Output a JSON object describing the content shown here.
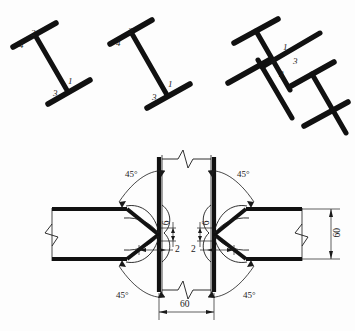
{
  "drawing": {
    "title": "Welded beam-to-column joint weld sequence detail",
    "ink_color": "#111111",
    "thin_line_color": "#1a1a1a"
  },
  "figures": [
    {
      "id": "fig-1",
      "name": "i-beam-tilted-left",
      "description": "Tilted I-section with weld pass numbers",
      "labels": [
        {
          "text": "2",
          "name": "weld-pass-2"
        },
        {
          "text": "4",
          "name": "weld-pass-4"
        },
        {
          "text": "1",
          "name": "weld-pass-1"
        },
        {
          "text": "3",
          "name": "weld-pass-3"
        }
      ]
    },
    {
      "id": "fig-2",
      "name": "i-beam-tilted-middle",
      "description": "Tilted I-section with weld pass numbers",
      "labels": [
        {
          "text": "2",
          "name": "weld-pass-2"
        },
        {
          "text": "4",
          "name": "weld-pass-4"
        },
        {
          "text": "1",
          "name": "weld-pass-1"
        },
        {
          "text": "3",
          "name": "weld-pass-3"
        }
      ]
    },
    {
      "id": "fig-3",
      "name": "double-i-beam-cross",
      "description": "Crossed double-T section with weld pass numbers at centre",
      "labels": [
        {
          "text": "1",
          "name": "weld-pass-1"
        },
        {
          "text": "4",
          "name": "weld-pass-4"
        },
        {
          "text": "3",
          "name": "weld-pass-3"
        },
        {
          "text": "2",
          "name": "weld-pass-2"
        }
      ]
    }
  ],
  "detail": {
    "name": "weld-groove-detail",
    "angles": {
      "top_left": "45°",
      "top_right": "45°",
      "bottom_left": "45°",
      "bottom_right": "45°"
    },
    "dimensions": {
      "root_gap_left": "2",
      "root_gap_right": "2",
      "root_face_left": "6",
      "root_face_right": "6",
      "column_width": "60",
      "beam_depth": "60"
    }
  }
}
